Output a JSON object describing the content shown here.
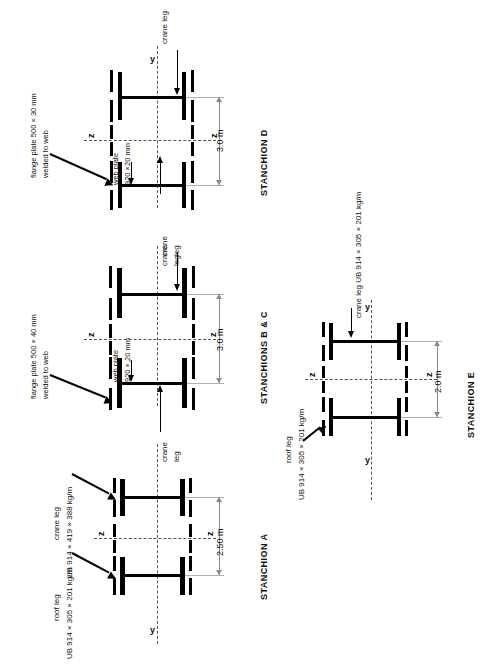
{
  "figure": {
    "type": "engineering-section-diagram",
    "orientation": "rotated-90-ccw"
  },
  "groups": [
    {
      "id": "stanchion-d",
      "title": "STANCHION D",
      "dimension": "3.0 m",
      "axis_labels": {
        "y": "y",
        "z_top": "z",
        "z_bottom": "z"
      },
      "annotations": [
        {
          "name": "flange-plate-note",
          "text_line1": "flange plate 500 × 30 mm",
          "text_line2": "welded to web"
        },
        {
          "name": "web-plate-note",
          "text_line1": "web plate",
          "text_line2": "920 ×20 mm"
        },
        {
          "name": "crane-leg-note-upper",
          "text_line1": "crane leg"
        },
        {
          "name": "crane-leg-note-lower",
          "text_line1": "crane",
          "text_line2": "leg"
        }
      ]
    },
    {
      "id": "stanchions-bc",
      "title": "STANCHIONS B & C",
      "dimension": "3.0 m",
      "axis_labels": {
        "y": "y",
        "z_top": "z",
        "z_bottom": "z"
      },
      "annotations": [
        {
          "name": "flange-plate-note",
          "text_line1": "flange plate 500 × 40 mm",
          "text_line2": "welded to web"
        },
        {
          "name": "web-plate-note",
          "text_line1": "web plate",
          "text_line2": "920 ×,20 mm"
        },
        {
          "name": "crane-leg-note-upper",
          "text_line1": "crane",
          "text_line2": "leg"
        },
        {
          "name": "crane-leg-note-lower",
          "text_line1": "crane",
          "text_line2": "leg"
        }
      ]
    },
    {
      "id": "stanchion-a",
      "title": "STANCHION A",
      "dimension": "2.50 m",
      "axis_labels": {
        "y": "y",
        "z_top": "z",
        "z_bottom": "z"
      },
      "annotations": [
        {
          "name": "crane-leg-section-note",
          "text_line1": "crane leg",
          "text_line2": "UB 914 × 419 × 388 kg/m"
        },
        {
          "name": "roof-leg-section-note",
          "text_line1": "roof leg",
          "text_line2": "UB 914 × 305 × 201 kg/m"
        }
      ]
    },
    {
      "id": "stanchion-e",
      "title": "STANCHION E",
      "dimension": "2.0 m",
      "axis_labels": {
        "y_top": "y",
        "y_bottom": "y",
        "z_left": "z",
        "z_right": "z"
      },
      "annotations": [
        {
          "name": "crane-leg-section-note",
          "text_line1": "crane leg UB 914 × 305 × 201 kg/m"
        },
        {
          "name": "roof-leg-section-note",
          "text_line1": "roof leg",
          "text_line2": "UB 914 × 305 × 201 kg/m"
        }
      ]
    }
  ],
  "colors": {
    "ink": "#000000",
    "background": "#ffffff",
    "dimension_line": "#8a8a8a",
    "centre_line": "#555555"
  }
}
